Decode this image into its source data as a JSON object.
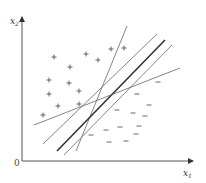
{
  "diagram": {
    "title": "",
    "axes": {
      "x_label": "x",
      "x_sub": "1",
      "y_label": "x",
      "y_sub": "2",
      "origin": "0",
      "color": "#444444"
    },
    "markers": {
      "positive_symbol": "+",
      "negative_symbol": "–",
      "color": "#555555"
    },
    "positive_points": [
      [
        54,
        57
      ],
      [
        70,
        67
      ],
      [
        86,
        54
      ],
      [
        98,
        60
      ],
      [
        111,
        49
      ],
      [
        124,
        48
      ],
      [
        49,
        80
      ],
      [
        69,
        83
      ],
      [
        79,
        91
      ],
      [
        49,
        94
      ],
      [
        58,
        106
      ],
      [
        79,
        104
      ],
      [
        43,
        115
      ]
    ],
    "negative_points": [
      [
        158,
        82
      ],
      [
        137,
        94
      ],
      [
        149,
        105
      ],
      [
        117,
        110
      ],
      [
        133,
        113
      ],
      [
        145,
        116
      ],
      [
        139,
        126
      ],
      [
        120,
        127
      ],
      [
        106,
        130
      ],
      [
        136,
        134
      ],
      [
        109,
        142
      ],
      [
        126,
        141
      ],
      [
        91,
        135
      ]
    ],
    "lines": [
      {
        "name": "steep-line",
        "x1": 76,
        "y1": 151,
        "x2": 127,
        "y2": 26,
        "width": 0.8,
        "color": "#666666"
      },
      {
        "name": "upper-margin-line",
        "x1": 43,
        "y1": 144,
        "x2": 157,
        "y2": 34,
        "width": 0.8,
        "color": "#666666"
      },
      {
        "name": "optimal-hyperplane",
        "x1": 57,
        "y1": 151,
        "x2": 165,
        "y2": 40,
        "width": 1.6,
        "color": "#333333"
      },
      {
        "name": "lower-margin-line",
        "x1": 64,
        "y1": 155,
        "x2": 172,
        "y2": 45,
        "width": 0.8,
        "color": "#666666"
      },
      {
        "name": "flat-line",
        "x1": 34,
        "y1": 125,
        "x2": 180,
        "y2": 68,
        "width": 0.8,
        "color": "#666666"
      }
    ]
  }
}
